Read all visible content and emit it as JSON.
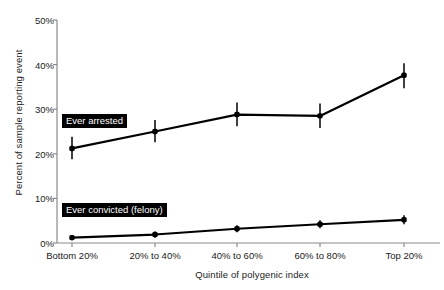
{
  "chart_data": {
    "type": "line",
    "title": "",
    "subtitle": "",
    "xlabel": "Quintile of polygenic index",
    "ylabel": "Percent of sample reporting event",
    "categories": [
      "Bottom 20%",
      "20% to 40%",
      "40% to 60%",
      "60% to 80%",
      "Top 20%"
    ],
    "ylim": [
      0,
      50
    ],
    "yticks": [
      0,
      10,
      20,
      30,
      40,
      50
    ],
    "ytick_labels": [
      "0%",
      "10%",
      "20%",
      "30%",
      "40%",
      "50%"
    ],
    "grid": false,
    "legend_position": "inline-annotations",
    "error_bars": true,
    "series": [
      {
        "name": "Ever arrested",
        "values": [
          21.2,
          25.0,
          28.8,
          28.5,
          37.6
        ],
        "err_low": [
          18.8,
          22.6,
          26.2,
          25.8,
          34.7
        ],
        "err_high": [
          23.8,
          27.6,
          31.5,
          31.3,
          40.3
        ],
        "color": "#000000"
      },
      {
        "name": "Ever convicted (felony)",
        "values": [
          1.2,
          1.9,
          3.2,
          4.2,
          5.2
        ],
        "err_low": [
          0.6,
          1.2,
          2.4,
          3.3,
          4.2
        ],
        "err_high": [
          1.8,
          2.6,
          4.0,
          5.1,
          6.2
        ],
        "color": "#000000"
      }
    ],
    "annotations": [
      {
        "text": "Ever arrested",
        "style": "white-on-black-box"
      },
      {
        "text": "Ever convicted (felony)",
        "style": "white-on-black-box"
      }
    ]
  },
  "axis": {
    "y_title": "Percent of sample reporting event",
    "x_title": "Quintile of polygenic index",
    "y_labels": [
      "50%",
      "40%",
      "30%",
      "20%",
      "10%",
      "0%"
    ],
    "x_labels": [
      "Bottom 20%",
      "20% to 40%",
      "40% to 60%",
      "60% to 80%",
      "Top 20%"
    ]
  },
  "labels": {
    "arrested": "Ever arrested",
    "convicted": "Ever convicted (felony)"
  },
  "colors": {
    "line": "#000000",
    "axis": "#8a8a8a",
    "text": "#1a1a1a",
    "background": "#ffffff"
  }
}
